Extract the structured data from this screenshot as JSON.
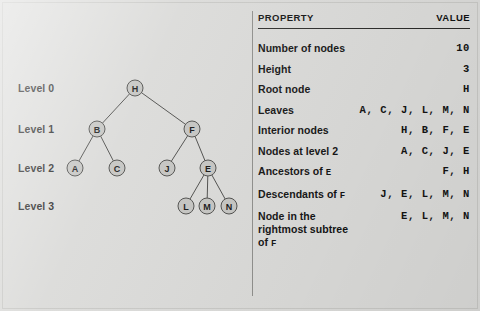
{
  "figure": {
    "background_color": "#d9d9d7",
    "node_fill_color": "#c3c3c0",
    "node_stroke_color": "#4a4a48"
  },
  "tree": {
    "level_labels": [
      {
        "text": "Level 0",
        "y": 88
      },
      {
        "text": "Level 1",
        "y": 129
      },
      {
        "text": "Level 2",
        "y": 168
      },
      {
        "text": "Level 3",
        "y": 206
      }
    ],
    "nodes": [
      {
        "id": "H",
        "label": "H",
        "x": 135,
        "y": 88,
        "level": 0
      },
      {
        "id": "B",
        "label": "B",
        "x": 97,
        "y": 129,
        "level": 1
      },
      {
        "id": "F",
        "label": "F",
        "x": 192,
        "y": 129,
        "level": 1
      },
      {
        "id": "A",
        "label": "A",
        "x": 75,
        "y": 168,
        "level": 2
      },
      {
        "id": "C",
        "label": "C",
        "x": 117,
        "y": 168,
        "level": 2
      },
      {
        "id": "J",
        "label": "J",
        "x": 167,
        "y": 168,
        "level": 2
      },
      {
        "id": "E",
        "label": "E",
        "x": 208,
        "y": 168,
        "level": 2
      },
      {
        "id": "L",
        "label": "L",
        "x": 186,
        "y": 206,
        "level": 3
      },
      {
        "id": "M",
        "label": "M",
        "x": 207,
        "y": 206,
        "level": 3
      },
      {
        "id": "N",
        "label": "N",
        "x": 229,
        "y": 206,
        "level": 3
      }
    ],
    "edges": [
      {
        "from": "H",
        "to": "B"
      },
      {
        "from": "H",
        "to": "F"
      },
      {
        "from": "B",
        "to": "A"
      },
      {
        "from": "B",
        "to": "C"
      },
      {
        "from": "F",
        "to": "J"
      },
      {
        "from": "F",
        "to": "E"
      },
      {
        "from": "E",
        "to": "L"
      },
      {
        "from": "E",
        "to": "M"
      },
      {
        "from": "E",
        "to": "N"
      }
    ],
    "node_radius": 8
  },
  "table": {
    "header": {
      "property": "PROPERTY",
      "value": "VALUE"
    },
    "rows": [
      {
        "property": "Number of nodes",
        "property_suffix": "",
        "value": "10"
      },
      {
        "property": "Height",
        "property_suffix": "",
        "value": "3"
      },
      {
        "property": "Root node",
        "property_suffix": "",
        "value": "H"
      },
      {
        "property": "Leaves",
        "property_suffix": "",
        "value": "A, C, J, L, M, N"
      },
      {
        "property": "Interior nodes",
        "property_suffix": "",
        "value": "H, B, F, E"
      },
      {
        "property": "Nodes at level 2",
        "property_suffix": "",
        "value": "A, C, J, E"
      },
      {
        "property": "Ancestors of ",
        "property_suffix": "E",
        "value": "F, H"
      },
      {
        "property": "Descendants of ",
        "property_suffix": "F",
        "value": "J, E, L, M, N"
      },
      {
        "property": "Node in the\nrightmost subtree of ",
        "property_suffix": "F",
        "value": "E, L, M, N"
      }
    ]
  }
}
